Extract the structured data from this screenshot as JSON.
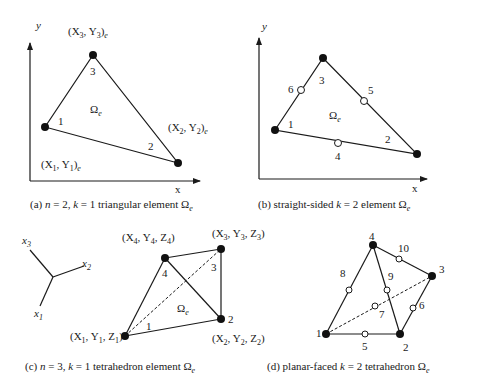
{
  "panels": {
    "a": {
      "caption": "(a)  n = 2,  k = 1 triangular element Ωe",
      "axis_x": "x",
      "axis_y": "y",
      "omega": "Ω",
      "omega_sub": "e",
      "nodes": [
        {
          "id": "1",
          "coord": "(X1, Y1)e"
        },
        {
          "id": "2",
          "coord": "(X2, Y2)e"
        },
        {
          "id": "3",
          "coord": "(X3, Y3)e"
        }
      ],
      "coord_labels": {
        "n1": "(X",
        "n1s": "1",
        "n1m": ", Y",
        "n1s2": "1",
        "n1e": ")",
        "n2": "(X",
        "n2s": "2",
        "n2m": ", Y",
        "n2s2": "2",
        "n2e": ")",
        "n3": "(X",
        "n3s": "3",
        "n3m": ", Y",
        "n3s2": "3",
        "n3e": ")",
        "sub_e": "e"
      }
    },
    "b": {
      "caption_pre": "(b) straight-sided ",
      "caption_k": "k",
      "caption_post": " = 2 element Ω",
      "caption_sub": "e",
      "axis_x": "x",
      "axis_y": "y",
      "omega": "Ω",
      "omega_sub": "e",
      "vertex_nodes": [
        "1",
        "2",
        "3"
      ],
      "midside_nodes": [
        "4",
        "5",
        "6"
      ]
    },
    "c": {
      "caption_pre": "(c)  ",
      "caption_n": "n",
      "caption_mid": " = 3,  ",
      "caption_k": "k",
      "caption_post": " = 1 tetrahedron element Ω",
      "caption_sub": "e",
      "axes": {
        "x1": "x",
        "x1s": "1",
        "x2": "x",
        "x2s": "2",
        "x3": "x",
        "x3s": "3"
      },
      "omega": "Ω",
      "omega_sub": "e",
      "vertex_nodes": [
        "1",
        "2",
        "3",
        "4"
      ],
      "coord_labels": {
        "n1": [
          "(X",
          "1",
          ", Y",
          "1",
          ", Z",
          "1",
          ")"
        ],
        "n2": [
          "(X",
          "2",
          ", Y",
          "2",
          ", Z",
          "2",
          ")"
        ],
        "n3": [
          "(X",
          "3",
          ", Y",
          "3",
          ", Z",
          "3",
          ")"
        ],
        "n4": [
          "(X",
          "4",
          ", Y",
          "4",
          ", Z",
          "4",
          ")"
        ]
      }
    },
    "d": {
      "caption_pre": "(d) planar-faced ",
      "caption_k": "k",
      "caption_post": " = 2 tetrahedron Ω",
      "caption_sub": "e",
      "vertex_nodes": [
        "1",
        "2",
        "3",
        "4"
      ],
      "midside_nodes": [
        "5",
        "6",
        "7",
        "8",
        "9",
        "10"
      ]
    }
  },
  "caption_a": {
    "pre": "(a)  ",
    "n": "n",
    "mid": " = 2,  ",
    "k": "k",
    "post": " = 1 triangular element Ω",
    "sub": "e"
  }
}
